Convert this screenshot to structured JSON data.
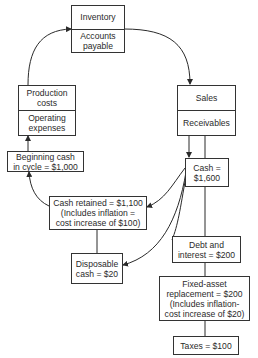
{
  "nodes": {
    "inventory": {
      "top": "Inventory",
      "bottom": "Accounts\npayable"
    },
    "production": {
      "top": "Production\ncosts",
      "bottom": "Operating\nexpenses"
    },
    "sales": {
      "top": "Sales",
      "bottom": "Receivables"
    },
    "beginning_cash": "Beginning cash\nin cycle = $1,000",
    "cash": "Cash =\n$1,600",
    "cash_retained": "Cash retained = $1,100\n(Includes inflation =\ncost increase of $100)",
    "disposable_cash": "Disposable\ncash = $20",
    "debt_interest": "Debt and\ninterest = $200",
    "fixed_asset": "Fixed-asset\nreplacement = $200\n(Includes inflation-\ncost increase of $20)",
    "taxes": "Taxes = $100"
  },
  "colors": {
    "line": "#2a2a2a",
    "box_border": "#333333",
    "background": "#ffffff"
  }
}
